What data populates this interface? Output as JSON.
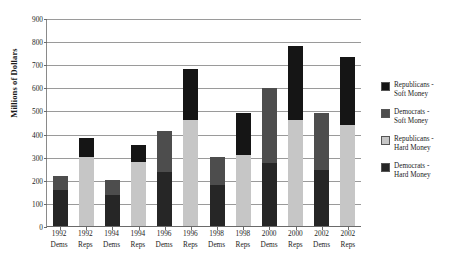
{
  "chart_data": {
    "type": "bar",
    "subtype": "stacked-vertical",
    "title": "",
    "xlabel": "",
    "ylabel": "Millions of Dollars",
    "ylim": [
      0,
      900
    ],
    "ytick_step": 100,
    "yticks": [
      "0",
      "100",
      "200",
      "300",
      "400",
      "500",
      "600",
      "700",
      "800",
      "900"
    ],
    "grid": true,
    "legend_position": "right",
    "categories": [
      {
        "year": "1992",
        "party": "Dems"
      },
      {
        "year": "1992",
        "party": "Reps"
      },
      {
        "year": "1994",
        "party": "Dems"
      },
      {
        "year": "1994",
        "party": "Reps"
      },
      {
        "year": "1996",
        "party": "Dems"
      },
      {
        "year": "1996",
        "party": "Reps"
      },
      {
        "year": "1998",
        "party": "Dems"
      },
      {
        "year": "1998",
        "party": "Reps"
      },
      {
        "year": "2000",
        "party": "Dems"
      },
      {
        "year": "2000",
        "party": "Reps"
      },
      {
        "year": "2002",
        "party": "Dems"
      },
      {
        "year": "2002",
        "party": "Reps"
      }
    ],
    "category_labels": [
      "1992 Dems",
      "1992 Reps",
      "1994 Dems",
      "1994 Reps",
      "1996 Dems",
      "1996 Reps",
      "1998 Dems",
      "1998 Reps",
      "2000 Dems",
      "2000 Reps",
      "2002 Dems",
      "2002 Reps"
    ],
    "series": [
      {
        "name": "Republicans - Soft Money",
        "color": "#151515",
        "values": [
          null,
          82,
          null,
          75,
          null,
          220,
          null,
          185,
          null,
          320,
          null,
          295
        ]
      },
      {
        "name": "Democrats - Soft Money",
        "color": "#4d4d4d",
        "values": [
          60,
          null,
          65,
          null,
          175,
          null,
          125,
          null,
          325,
          null,
          250,
          null
        ]
      },
      {
        "name": "Republicans - Hard Money",
        "color": "#c6c6c6",
        "values": [
          null,
          303,
          null,
          280,
          null,
          465,
          null,
          310,
          null,
          465,
          null,
          440
        ]
      },
      {
        "name": "Democrats - Hard Money",
        "color": "#262626",
        "values": [
          160,
          null,
          140,
          null,
          240,
          null,
          180,
          null,
          275,
          null,
          245,
          null
        ]
      }
    ],
    "bars": [
      {
        "label": "1992 Dems",
        "hard": 160,
        "soft": 60,
        "total": 220,
        "hard_color": "#262626",
        "soft_color": "#4d4d4d"
      },
      {
        "label": "1992 Reps",
        "hard": 303,
        "soft": 82,
        "total": 385,
        "hard_color": "#c6c6c6",
        "soft_color": "#151515"
      },
      {
        "label": "1994 Dems",
        "hard": 140,
        "soft": 65,
        "total": 205,
        "hard_color": "#262626",
        "soft_color": "#4d4d4d"
      },
      {
        "label": "1994 Reps",
        "hard": 280,
        "soft": 75,
        "total": 355,
        "hard_color": "#c6c6c6",
        "soft_color": "#151515"
      },
      {
        "label": "1996 Dems",
        "hard": 240,
        "soft": 175,
        "total": 415,
        "hard_color": "#262626",
        "soft_color": "#4d4d4d"
      },
      {
        "label": "1996 Reps",
        "hard": 465,
        "soft": 220,
        "total": 685,
        "hard_color": "#c6c6c6",
        "soft_color": "#151515"
      },
      {
        "label": "1998 Dems",
        "hard": 180,
        "soft": 125,
        "total": 305,
        "hard_color": "#262626",
        "soft_color": "#4d4d4d"
      },
      {
        "label": "1998 Reps",
        "hard": 310,
        "soft": 185,
        "total": 495,
        "hard_color": "#c6c6c6",
        "soft_color": "#151515"
      },
      {
        "label": "2000 Dems",
        "hard": 275,
        "soft": 325,
        "total": 600,
        "hard_color": "#262626",
        "soft_color": "#4d4d4d"
      },
      {
        "label": "2000 Reps",
        "hard": 465,
        "soft": 320,
        "total": 785,
        "hard_color": "#c6c6c6",
        "soft_color": "#151515"
      },
      {
        "label": "2002 Dems",
        "hard": 245,
        "soft": 250,
        "total": 495,
        "hard_color": "#262626",
        "soft_color": "#4d4d4d"
      },
      {
        "label": "2002 Reps",
        "hard": 440,
        "soft": 295,
        "total": 735,
        "hard_color": "#c6c6c6",
        "soft_color": "#151515"
      }
    ],
    "legend": [
      {
        "label_line1": "Republicans -",
        "label_line2": "Soft Money",
        "color": "#151515"
      },
      {
        "label_line1": "Democrats -",
        "label_line2": "Soft Money",
        "color": "#4d4d4d"
      },
      {
        "label_line1": "Republicans -",
        "label_line2": "Hard Money",
        "color": "#c6c6c6"
      },
      {
        "label_line1": "Democrats -",
        "label_line2": "Hard Money",
        "color": "#262626"
      }
    ]
  }
}
